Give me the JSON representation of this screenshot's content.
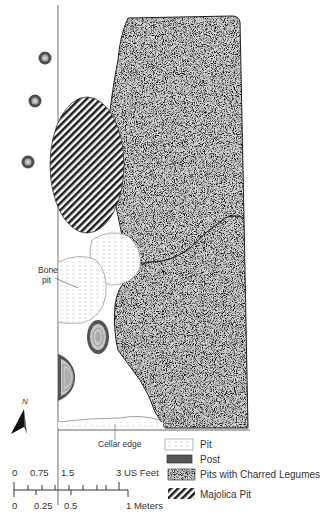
{
  "diagram": {
    "type": "archaeological site plan",
    "labels": {
      "bone_pit_line1": "Bone",
      "bone_pit_line2": "pit",
      "cellar_edge": "Cellar edge",
      "north": "N"
    },
    "legend": {
      "items": [
        {
          "key": "pit",
          "label": "Pit"
        },
        {
          "key": "post",
          "label": "Post"
        },
        {
          "key": "charred",
          "label": "Pits with Charred Legumes"
        },
        {
          "key": "majolica",
          "label": "Majolica Pit"
        }
      ]
    },
    "scale_bar": {
      "feet_ticks": [
        "0",
        "0.75",
        "1.5",
        "3 US Feet"
      ],
      "meter_ticks": [
        "0",
        "0.25",
        "0.5",
        "1 Meters"
      ]
    },
    "colors": {
      "line": "#555555",
      "post_outer": "#555555",
      "post_inner": "#bbbbbb",
      "stipple_dark": "#3a3a3a",
      "stipple_light": "#ffffff",
      "pit_hatch": "#c8c8c8"
    }
  }
}
